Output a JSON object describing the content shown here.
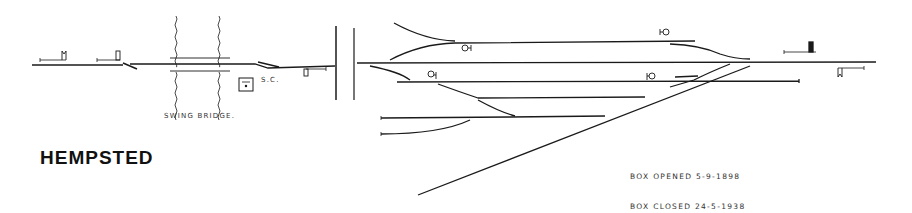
{
  "diagram": {
    "title": "HEMPSTED",
    "labels": {
      "swing_bridge": "SWING BRIDGE.",
      "signal_cabin": "S.C."
    },
    "notes": {
      "box_opened": "BOX OPENED  5-9-1898",
      "box_closed": "BOX CLOSED  24-5-1938"
    },
    "colors": {
      "line": "#1a1a1a",
      "background": "#ffffff"
    }
  }
}
